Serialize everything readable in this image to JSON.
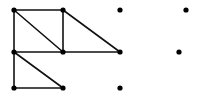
{
  "diagram": {
    "type": "graph",
    "width": 198,
    "height": 100,
    "colors": {
      "edge": "#111111",
      "node": "#000000",
      "background": "#ffffff"
    },
    "nodes": [
      {
        "id": "a",
        "x": 14,
        "y": 10
      },
      {
        "id": "b",
        "x": 63,
        "y": 10
      },
      {
        "id": "c",
        "x": 120,
        "y": 10
      },
      {
        "id": "d",
        "x": 186,
        "y": 10
      },
      {
        "id": "e",
        "x": 14,
        "y": 52
      },
      {
        "id": "f",
        "x": 63,
        "y": 52
      },
      {
        "id": "g",
        "x": 120,
        "y": 52
      },
      {
        "id": "h",
        "x": 179,
        "y": 52
      },
      {
        "id": "i",
        "x": 14,
        "y": 88
      },
      {
        "id": "j",
        "x": 63,
        "y": 88
      },
      {
        "id": "k",
        "x": 120,
        "y": 88
      }
    ],
    "edges": [
      [
        "a",
        "b"
      ],
      [
        "a",
        "e"
      ],
      [
        "a",
        "f"
      ],
      [
        "b",
        "f"
      ],
      [
        "b",
        "g"
      ],
      [
        "e",
        "f"
      ],
      [
        "f",
        "g"
      ],
      [
        "e",
        "i"
      ],
      [
        "e",
        "j"
      ],
      [
        "i",
        "j"
      ]
    ]
  }
}
